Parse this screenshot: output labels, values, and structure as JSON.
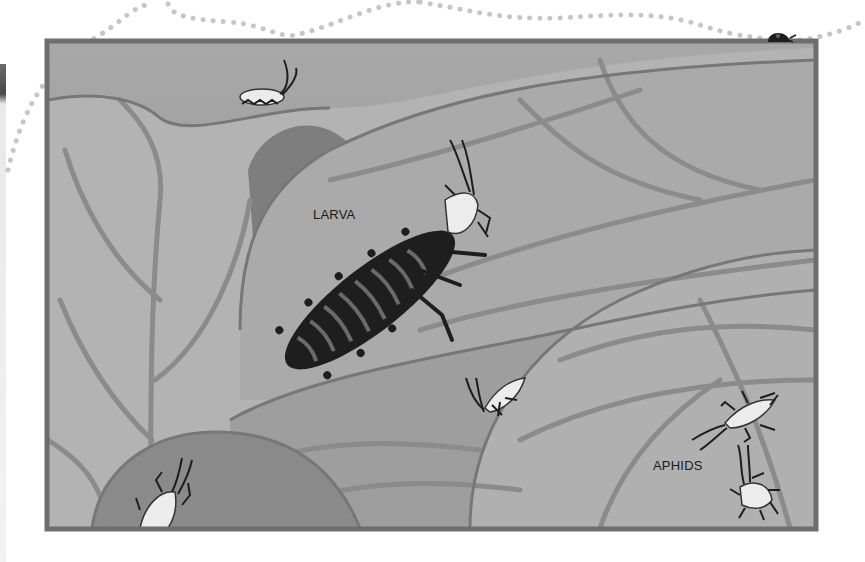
{
  "illustration": {
    "description": "Grayscale painted illustration of a ladybug larva eating aphids on leaves",
    "labels": {
      "larva": "LARVA",
      "aphids": "APHIDS"
    },
    "colors": {
      "background": "#ffffff",
      "frame_border": "#6e6e6e",
      "sky": "#9a9a9a",
      "leaf_light": "#b8b8b8",
      "leaf_mid": "#a2a2a2",
      "leaf_dark": "#7c7c7c",
      "vein": "#8a8a8a",
      "insect_dark": "#1e1e1e",
      "aphid_body": "#e6e6e6",
      "dotted_trail": "#c8c8c8"
    },
    "elements": [
      "dotted-trail",
      "ladybug-on-frame",
      "larva",
      "aphid-top",
      "aphid-near-larva",
      "aphid-center",
      "aphid-bottom-left",
      "aphid-right-1",
      "aphid-right-2"
    ]
  }
}
